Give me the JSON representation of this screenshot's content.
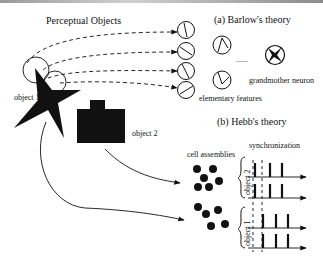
{
  "figure": {
    "left": {
      "title": "Perceptual Objects",
      "object1_label": "object 1",
      "object2_label": "object 2"
    },
    "barlow": {
      "title": "(a) Barlow's theory",
      "features_label": "elementary features",
      "ellipsis": "......",
      "grandmother_label": "grandmother neuron"
    },
    "hebb": {
      "title": "(b) Hebb's theory",
      "cell_assemblies_label": "cell assemblies",
      "synchronization_label": "synchronization",
      "group_top_label": "object 2",
      "group_bottom_label": "object 1"
    },
    "colors": {
      "ink": "#111111",
      "background": "#ffffff"
    }
  }
}
